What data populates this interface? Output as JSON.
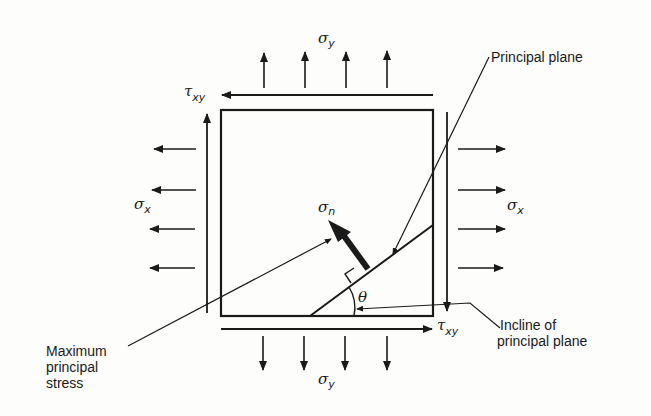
{
  "diagram": {
    "labels": {
      "sigma_y_top": {
        "symbol": "σ",
        "sub": "y"
      },
      "sigma_y_bottom": {
        "symbol": "σ",
        "sub": "y"
      },
      "sigma_x_left": {
        "symbol": "σ",
        "sub": "x"
      },
      "sigma_x_right": {
        "symbol": "σ",
        "sub": "x"
      },
      "tau_xy_top": {
        "symbol": "τ",
        "sub": "xy"
      },
      "tau_xy_bottom": {
        "symbol": "τ",
        "sub": "xy"
      },
      "sigma_n": {
        "symbol": "σ",
        "sub": "n"
      },
      "theta": "θ",
      "principal_plane": "Principal  plane",
      "incline_line1": "Incline of",
      "incline_line2": "principal plane",
      "max_line1": "Maximum",
      "max_line2": "principal",
      "max_line3": "stress"
    },
    "colors": {
      "ink": "#1a1a1a",
      "background": "#fdfdfc"
    }
  }
}
